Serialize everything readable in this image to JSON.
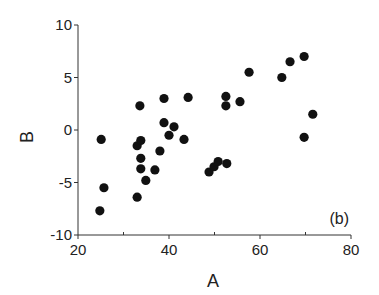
{
  "chart_data": {
    "type": "scatter",
    "title": "",
    "xlabel": "A",
    "ylabel": "B",
    "panel_label": "(b)",
    "xlim": [
      20,
      80
    ],
    "ylim": [
      -10,
      10
    ],
    "xticks": [
      20,
      40,
      60,
      80
    ],
    "xminor_ticks": [
      30,
      50,
      70
    ],
    "yticks": [
      -10,
      -5,
      0,
      5,
      10
    ],
    "grid": false,
    "legend": null,
    "marker_color": "#111111",
    "points": [
      {
        "x": 24.8,
        "y": -7.7
      },
      {
        "x": 25.1,
        "y": -0.9
      },
      {
        "x": 25.7,
        "y": -5.5
      },
      {
        "x": 33.0,
        "y": -6.4
      },
      {
        "x": 33.6,
        "y": 2.3
      },
      {
        "x": 33.0,
        "y": -1.5
      },
      {
        "x": 33.8,
        "y": -1.0
      },
      {
        "x": 33.8,
        "y": -2.7
      },
      {
        "x": 33.8,
        "y": -3.7
      },
      {
        "x": 34.9,
        "y": -4.8
      },
      {
        "x": 36.9,
        "y": -3.8
      },
      {
        "x": 38.0,
        "y": -2.0
      },
      {
        "x": 38.9,
        "y": 3.0
      },
      {
        "x": 38.9,
        "y": 0.7
      },
      {
        "x": 40.0,
        "y": -0.5
      },
      {
        "x": 41.1,
        "y": 0.3
      },
      {
        "x": 43.3,
        "y": -0.9
      },
      {
        "x": 44.2,
        "y": 3.1
      },
      {
        "x": 48.8,
        "y": -4.0
      },
      {
        "x": 49.9,
        "y": -3.5
      },
      {
        "x": 50.8,
        "y": -3.0
      },
      {
        "x": 52.7,
        "y": -3.2
      },
      {
        "x": 52.5,
        "y": 3.2
      },
      {
        "x": 52.5,
        "y": 2.3
      },
      {
        "x": 55.6,
        "y": 2.7
      },
      {
        "x": 57.6,
        "y": 5.5
      },
      {
        "x": 64.8,
        "y": 5.0
      },
      {
        "x": 66.6,
        "y": 6.5
      },
      {
        "x": 69.7,
        "y": 7.0
      },
      {
        "x": 71.6,
        "y": 1.5
      },
      {
        "x": 69.7,
        "y": -0.7
      }
    ]
  }
}
